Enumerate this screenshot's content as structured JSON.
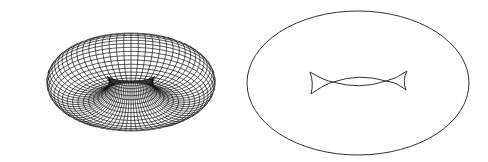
{
  "figure": {
    "panels": [
      {
        "id": "torus-wireframe",
        "description": "Wireframe mesh of a torus viewed obliquely",
        "center": [
          131,
          82
        ],
        "major_radius": 68,
        "minor_radius": 40,
        "tilt_deg": 55,
        "u_steps": 72,
        "v_steps": 36,
        "stroke": "#111111"
      },
      {
        "id": "torus-apparent-contour",
        "description": "Apparent contour of the torus: outer outline and inner curve with swallowtail cusps",
        "outer_ellipse": {
          "cx": 358,
          "cy": 83,
          "rx": 111,
          "ry": 72
        },
        "inner_curve": {
          "left_cusps": [
            [
              310,
              72
            ],
            [
              311,
              94
            ]
          ],
          "crossings": [
            [
              333,
              82
            ],
            [
              386,
              81
            ]
          ],
          "right_cusps": [
            [
              407,
              71
            ],
            [
              406,
              90
            ]
          ]
        },
        "stroke": "#333333"
      }
    ]
  }
}
